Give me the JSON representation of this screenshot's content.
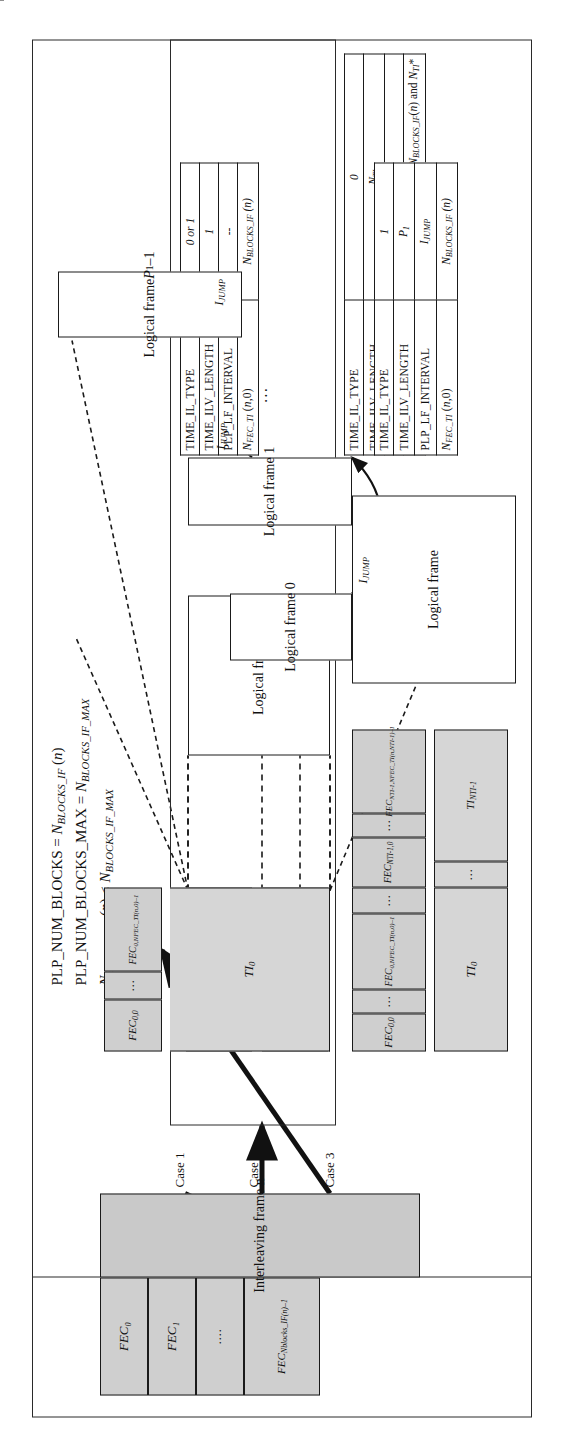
{
  "figure": {
    "title_formulas": [
      "PLP_NUM_BLOCKS = N_BLOCKS_IF (n)",
      "PLP_NUM_BLOCKS_MAX = N_BLOCKS_IF_MAX",
      "N_BLOCKS_IF (n) < N_BLOCKS_IF_MAX"
    ]
  },
  "interleaving_frame": {
    "label": "Interleaving frame n",
    "fec_blocks": [
      "FEC₀",
      "FEC₁",
      "····",
      "FEC Nblocks_IF(n)−1"
    ]
  },
  "case_labels": {
    "case1": "Case 1",
    "case2": "Case 2",
    "case3": "Case 3"
  },
  "case1": {
    "fec_blocks": [
      "FEC 0,0",
      "···",
      "FEC 0,NFEC_TI(n,0)−1",
      "···",
      "FEC NTI-1,0",
      "···",
      "FEC NTI-1,NFEC_TI(n,NTI-1)−1"
    ],
    "ti_blocks": [
      "TI₀",
      "···",
      "TI NTI-1"
    ],
    "logical_frame": "Logical frame",
    "table": {
      "rows": [
        {
          "name": "TIME_IL_TYPE",
          "value": "0"
        },
        {
          "name": "TIME_ILV_LENGTH",
          "value": "N TI"
        },
        {
          "name": "PLP_LF_INTERVAL",
          "value": "--"
        },
        {
          "name": "N FEC_TI (n,s)",
          "value": "Depends on the parameters N BLOCKS_IF (n) and N TI *"
        }
      ]
    }
  },
  "case2": {
    "fec_blocks": [
      "FEC 0,0",
      "···",
      "FEC 0,NFEC_TI(n,0)−1"
    ],
    "ti_blocks": [
      "TI₀"
    ],
    "logical_frame": "Logical frame",
    "table": {
      "rows": [
        {
          "name": "TIME_IL_TYPE",
          "value": "0 or 1"
        },
        {
          "name": "TIME_ILV_LENGTH",
          "value": "1"
        },
        {
          "name": "PLP_LF_INTERVAL",
          "value": "--"
        },
        {
          "name": "N FEC_TI (n,0)",
          "value": "N BLOCKS_IF (n)"
        }
      ]
    }
  },
  "case3": {
    "fec_blocks": [
      "FEC 0,0",
      "···",
      "FEC 0,NFEC_TI(n,0)−1"
    ],
    "ti_blocks": [
      "TI₀"
    ],
    "logical_frames": [
      "Logical frame 0",
      "Logical frame 1",
      "···",
      "Logical frame P₁−1"
    ],
    "jump_labels": [
      "I JUMP",
      "I JUMP",
      "I JUMP"
    ],
    "table": {
      "rows": [
        {
          "name": "TIME_IL_TYPE",
          "value": "1"
        },
        {
          "name": "TIME_ILV_LENGTH",
          "value": "P₁"
        },
        {
          "name": "PLP_LF_INTERVAL",
          "value": "I JUMP"
        },
        {
          "name": "N FEC_TI (n,0)",
          "value": "N BLOCKS_IF (n)"
        }
      ]
    }
  }
}
